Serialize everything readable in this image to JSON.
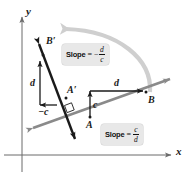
{
  "figure": {
    "background_color": "#ffffff",
    "width": 188,
    "height": 180
  },
  "axes": {
    "x_label": "x",
    "y_label": "y",
    "axis_color": "#6b6b6b",
    "origin": {
      "x": 22,
      "y": 155
    }
  },
  "points": {
    "A": "A",
    "B": "B",
    "A_prime": "A′",
    "B_prime": "B′"
  },
  "segments": {
    "rise_original": "c",
    "run_original": "d",
    "rise_rotated": "d",
    "run_rotated": "−c"
  },
  "slope_labels": [
    {
      "id": "slope-rotated",
      "word": "Slope",
      "equals": "=",
      "minus": "−",
      "numerator": "d",
      "denominator": "c",
      "text": "Slope = −d/c"
    },
    {
      "id": "slope-original",
      "word": "Slope",
      "equals": "=",
      "minus": "",
      "numerator": "c",
      "denominator": "d",
      "text": "Slope = c/d"
    }
  ],
  "colors": {
    "line_original": "#8a8a8a",
    "line_rotated": "#1a1a1a",
    "rotation_arrow": "#cfcfcf",
    "label_box": "#e8e8e8",
    "text": "#111111",
    "axis": "#6b6b6b"
  },
  "rotation_arrow": {
    "name": "rotation-arc-arrow",
    "description": "counterclockwise 90 degree rotation arc"
  }
}
